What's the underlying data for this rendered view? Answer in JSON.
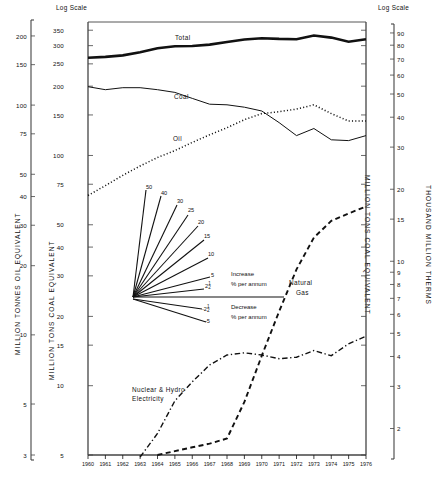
{
  "chart_data": {
    "type": "line",
    "title": "",
    "xlabel": "",
    "grid": false,
    "legend_position": "inline-annotations",
    "x": [
      1960,
      1961,
      1962,
      1963,
      1964,
      1965,
      1966,
      1967,
      1968,
      1969,
      1970,
      1971,
      1972,
      1973,
      1974,
      1975,
      1976
    ],
    "xtick_labels": [
      "1960",
      "1961",
      "1962",
      "1963",
      "1964",
      "1965",
      "1966",
      "1967",
      "1968",
      "1969",
      "1970",
      "1971",
      "1972",
      "1973",
      "1974",
      "1975",
      "1976"
    ],
    "axes": [
      {
        "name": "oil-axis",
        "side": "outer-left",
        "title": "MILLION TONNES OIL EQUIVALENT",
        "scale": "log",
        "cap": "",
        "ticks": [
          200,
          150,
          100,
          75,
          50,
          40,
          30,
          20,
          10,
          5,
          3
        ],
        "range": [
          3,
          230
        ]
      },
      {
        "name": "coal-axis",
        "side": "inner-left",
        "title": "MILLION TONS COAL EQUIVALENT",
        "scale": "log",
        "cap": "Log Scale",
        "ticks": [
          350,
          300,
          250,
          200,
          150,
          100,
          75,
          50,
          40,
          30,
          20,
          15,
          10,
          5
        ],
        "range": [
          5,
          380
        ]
      },
      {
        "name": "therms-axis",
        "side": "outer-right",
        "title": "THOUSAND MILLION THERMS",
        "scale": "log",
        "cap": "Log Scale",
        "ticks": [
          90,
          80,
          70,
          60,
          50,
          40,
          30,
          20,
          15,
          10,
          9,
          8,
          7,
          6,
          5,
          4,
          3,
          2
        ],
        "range": [
          1.55,
          100
        ]
      },
      {
        "name": "coal-axis-right",
        "side": "inner-right",
        "title": "MILLION TONS COAL EQUIVALENT",
        "scale": "log",
        "cap": "",
        "ticks": [],
        "range": [
          5,
          380
        ]
      }
    ],
    "series": [
      {
        "name": "Total",
        "style": "solid-thick",
        "values": [
          266,
          268,
          272,
          281,
          292,
          298,
          299,
          303,
          311,
          319,
          323,
          321,
          320,
          332,
          325,
          312,
          320
        ]
      },
      {
        "name": "Coal",
        "style": "solid-thin",
        "values": [
          199,
          193,
          197,
          197,
          193,
          188,
          177,
          167,
          166,
          162,
          156,
          139,
          122,
          131,
          117,
          116,
          122
        ]
      },
      {
        "name": "Oil",
        "style": "dotted",
        "values": [
          67,
          74,
          82,
          90,
          98,
          105,
          114,
          123,
          132,
          143,
          152,
          155,
          159,
          166,
          152,
          141,
          141
        ]
      },
      {
        "name": "Natural Gas",
        "style": "dashed",
        "values": [
          null,
          null,
          null,
          null,
          5.0,
          5.2,
          5.4,
          5.6,
          5.9,
          8.5,
          13.5,
          21,
          32,
          44,
          52,
          56,
          60
        ]
      },
      {
        "name": "Nuclear & Hydro Electricity",
        "style": "dash-dot",
        "values": [
          null,
          null,
          null,
          4.9,
          6.2,
          8.6,
          10.4,
          12.3,
          13.6,
          13.9,
          13.6,
          13.1,
          13.3,
          14.2,
          13.5,
          15.2,
          16.4
        ]
      }
    ],
    "fan_diagram": {
      "title_increase": "Increase",
      "title_increase_units": "% per annum",
      "title_decrease": "Decrease",
      "title_decrease_units": "% per annum",
      "increase_rates": [
        "50",
        "40",
        "30",
        "25",
        "20",
        "15",
        "10",
        "5",
        "2½"
      ],
      "decrease_rates": [
        "-2½",
        "-5"
      ]
    }
  },
  "labels": {
    "log_scale_left": "Log Scale",
    "log_scale_right": "Log Scale",
    "axis_oil": "MILLION TONNES OIL EQUIVALENT",
    "axis_coal_left": "MILLION TONS COAL EQUIVALENT",
    "axis_coal_right": "MILLION TONS COAL EQUIVALENT",
    "axis_therms": "THOUSAND MILLION THERMS",
    "series_total": "Total",
    "series_coal": "Coal",
    "series_oil": "Oil",
    "series_gas_l1": "Natural",
    "series_gas_l2": "Gas",
    "series_nuclear_l1": "Nuclear & Hydro",
    "series_nuclear_l2": "Electricity",
    "fan_increase": "Increase",
    "fan_increase_units": "% per annum",
    "fan_decrease": "Decrease",
    "fan_decrease_units": "% per annum",
    "fan_50": "50",
    "fan_40": "40",
    "fan_30": "30",
    "fan_25": "25",
    "fan_20": "20",
    "fan_15": "15",
    "fan_10": "10",
    "fan_5": "5",
    "fan_2h_whole": "2",
    "fan_2h_num": "1",
    "fan_2h_den": "2",
    "fan_m2h_whole": "-2",
    "fan_m2h_num": "1",
    "fan_m2h_den": "2",
    "fan_m5": "-5"
  },
  "colors": {
    "ink": "#111111",
    "axis": "#444444",
    "bg": "#ffffff"
  }
}
